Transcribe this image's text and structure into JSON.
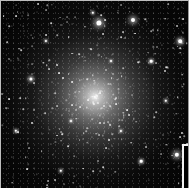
{
  "image": {
    "subject": "globular star cluster",
    "width": 189,
    "height": 188,
    "core_center": [
      94,
      96
    ],
    "colors": {
      "background": "#050505",
      "core": "#ffffff",
      "frame_border": "#bdbdbd",
      "inset_border": "#f2f2f2"
    }
  },
  "bright_stars": [
    {
      "x": 98,
      "y": 22,
      "r": 2.6
    },
    {
      "x": 132,
      "y": 19,
      "r": 2.0
    },
    {
      "x": 30,
      "y": 78,
      "r": 1.6
    },
    {
      "x": 179,
      "y": 40,
      "r": 1.8
    },
    {
      "x": 176,
      "y": 154,
      "r": 2.2
    },
    {
      "x": 92,
      "y": 12,
      "r": 1.2
    },
    {
      "x": 150,
      "y": 60,
      "r": 1.3
    },
    {
      "x": 15,
      "y": 130,
      "r": 1.2
    },
    {
      "x": 60,
      "y": 170,
      "r": 1.2
    },
    {
      "x": 140,
      "y": 160,
      "r": 1.3
    },
    {
      "x": 120,
      "y": 130,
      "r": 1.1
    },
    {
      "x": 45,
      "y": 40,
      "r": 1.1
    },
    {
      "x": 165,
      "y": 100,
      "r": 1.2
    },
    {
      "x": 110,
      "y": 60,
      "r": 1.0
    },
    {
      "x": 70,
      "y": 120,
      "r": 1.0
    }
  ],
  "inset": {
    "x": 181,
    "y": 143
  }
}
